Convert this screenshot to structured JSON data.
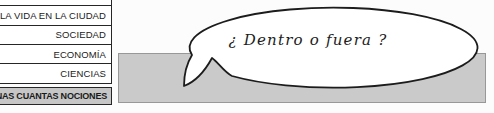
{
  "menu": {
    "items": [
      {
        "label": "LA GENTE"
      },
      {
        "label": "LA VIDA EN LA CIUDAD"
      },
      {
        "label": "SOCIEDAD"
      },
      {
        "label": "ECONOMÍA"
      },
      {
        "label": "CIENCIAS"
      },
      {
        "label": "UNAS CUANTAS NOCIONES"
      }
    ],
    "active_item": "UNAS CUANTAS NOCIONES"
  },
  "speech_bubble": {
    "text": "¿ Dentro o fuera ?"
  },
  "colors": {
    "menu_outline": "#262626",
    "active_item_gray": "#c6c6c6",
    "banner_gray": "#cacaca",
    "banner_border": "#989898",
    "bubble_outline": "#1c1c1c",
    "bubble_fill": "#ffffff"
  }
}
